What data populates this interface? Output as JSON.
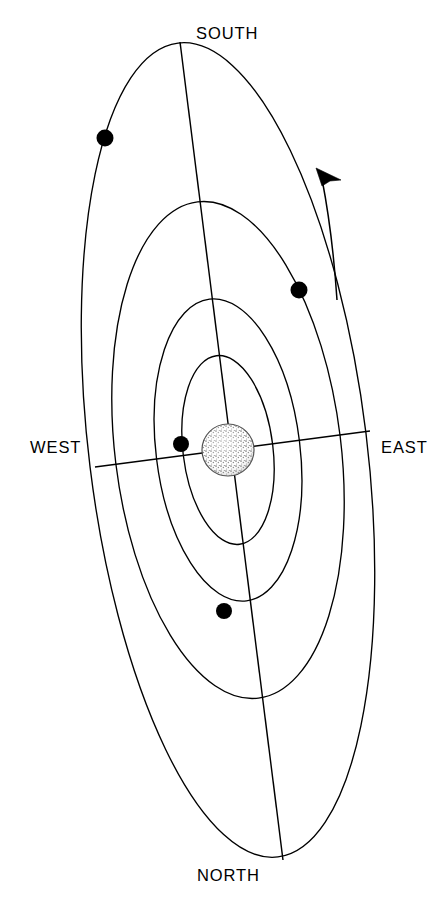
{
  "figure": {
    "background_color": "#ffffff",
    "line_color": "#000000",
    "width": 448,
    "height": 909
  },
  "labels": {
    "south": "SOUTH",
    "north": "NORTH",
    "west": "WEST",
    "east": "EAST"
  },
  "chart_data": {
    "type": "scatter",
    "xlabel": "",
    "ylabel": "",
    "projection": "tilted ellipses, inclined view",
    "cardinal_directions": {
      "top": "SOUTH",
      "bottom": "NORTH",
      "left": "WEST",
      "right": "EAST"
    },
    "central_body": {
      "name": "planet",
      "center_x": 228,
      "center_y": 450,
      "radius": 26,
      "fill_style": "stippled",
      "fill_color": "#d8d8d8",
      "outline_color": "#4a4a4a"
    },
    "orbits": [
      {
        "index": 1,
        "name": "orbit-1-innermost",
        "semi_major": 95,
        "semi_minor": 45,
        "rotation_deg": -7
      },
      {
        "index": 2,
        "name": "orbit-2",
        "semi_major": 152,
        "semi_minor": 72,
        "rotation_deg": -7
      },
      {
        "index": 3,
        "name": "orbit-3",
        "semi_major": 250,
        "semi_minor": 113,
        "rotation_deg": -7
      },
      {
        "index": 4,
        "name": "orbit-4-outermost",
        "semi_major": 410,
        "semi_minor": 139,
        "rotation_deg": -7
      }
    ],
    "satellites": [
      {
        "index": 1,
        "name": "moon-on-orbit-4",
        "x": 105,
        "y": 138,
        "radius": 8.5,
        "orbit": 4
      },
      {
        "index": 2,
        "name": "moon-on-orbit-3",
        "x": 299,
        "y": 290,
        "radius": 8.5,
        "orbit": 3
      },
      {
        "index": 3,
        "name": "moon-on-orbit-1",
        "x": 181,
        "y": 444,
        "radius": 8.0,
        "orbit": 1
      },
      {
        "index": 4,
        "name": "moon-on-orbit-2",
        "x": 224,
        "y": 611,
        "radius": 8.0,
        "orbit": 2
      }
    ],
    "axes": {
      "meridian_south_north": {
        "x1": 180,
        "y1": 42,
        "x2": 283,
        "y2": 860
      },
      "equator_west_east": {
        "x1": 95,
        "y1": 467,
        "x2": 370,
        "y2": 431
      }
    },
    "direction_arrow": {
      "name": "orbital-direction-arrow",
      "meaning": "direction of orbital motion",
      "tip_x": 318,
      "tip_y": 170,
      "tail_x": 337,
      "tail_y": 300
    },
    "legend": [],
    "grid": false
  }
}
